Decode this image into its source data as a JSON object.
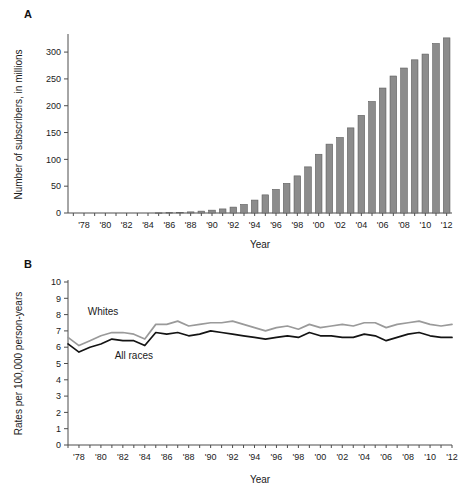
{
  "figure": {
    "panel_a_letter": "A",
    "panel_b_letter": "B"
  },
  "chart_data": [
    {
      "panel": "A",
      "type": "bar",
      "title": "",
      "xlabel": "Year",
      "ylabel": "Number of subscribers, in millions",
      "xlim": [
        1977,
        2012
      ],
      "ylim": [
        0,
        330
      ],
      "yticks": [
        0,
        50,
        100,
        150,
        200,
        250,
        300
      ],
      "ytick_labels": [
        "0",
        "50",
        "100",
        "150",
        "200",
        "250",
        "300"
      ],
      "xtick_labels": [
        "'78",
        "'80",
        "'82",
        "'84",
        "'86",
        "'88",
        "'90",
        "'92",
        "'94",
        "'96",
        "'98",
        "'00",
        "'02",
        "'04",
        "'06",
        "'08",
        "'10",
        "'12"
      ],
      "xtick_years": [
        1978,
        1980,
        1982,
        1984,
        1986,
        1988,
        1990,
        1992,
        1994,
        1996,
        1998,
        2000,
        2002,
        2004,
        2006,
        2008,
        2010,
        2012
      ],
      "grid": false,
      "legend": "none",
      "bar_color": "#8c8c8c",
      "categories": [
        1977,
        1978,
        1979,
        1980,
        1981,
        1982,
        1983,
        1984,
        1985,
        1986,
        1987,
        1988,
        1989,
        1990,
        1991,
        1992,
        1993,
        1994,
        1995,
        1996,
        1997,
        1998,
        1999,
        2000,
        2001,
        2002,
        2003,
        2004,
        2005,
        2006,
        2007,
        2008,
        2009,
        2010,
        2011,
        2012
      ],
      "values": [
        0,
        0,
        0,
        0,
        0,
        0,
        0,
        0,
        0.3,
        0.7,
        1.2,
        2.1,
        3.5,
        5.3,
        7.6,
        11.0,
        16.0,
        24.1,
        33.8,
        44.0,
        55.3,
        69.2,
        86.0,
        109.5,
        128.4,
        140.8,
        158.7,
        182.1,
        207.9,
        233.0,
        255.4,
        270.3,
        285.6,
        296.3,
        316.0,
        326.5
      ],
      "annotations": []
    },
    {
      "panel": "B",
      "type": "line",
      "title": "",
      "xlabel": "Year",
      "ylabel": "Rates per 100,000 person-years",
      "xlim": [
        1977,
        2012
      ],
      "ylim": [
        0,
        10
      ],
      "yticks": [
        0,
        1,
        2,
        3,
        4,
        5,
        6,
        7,
        8,
        9,
        10
      ],
      "ytick_labels": [
        "0",
        "1",
        "2",
        "3",
        "4",
        "5",
        "6",
        "7",
        "8",
        "9",
        "10"
      ],
      "xtick_labels": [
        "'78",
        "'80",
        "'82",
        "'84",
        "'86",
        "'88",
        "'90",
        "'92",
        "'94",
        "'96",
        "'98",
        "'00",
        "'02",
        "'04",
        "'06",
        "'08",
        "'10",
        "'12"
      ],
      "xtick_years": [
        1978,
        1980,
        1982,
        1984,
        1986,
        1988,
        1990,
        1992,
        1994,
        1996,
        1998,
        2000,
        2002,
        2004,
        2006,
        2008,
        2010,
        2012
      ],
      "grid": false,
      "legend": "inline-labels",
      "x": [
        1977,
        1978,
        1979,
        1980,
        1981,
        1982,
        1983,
        1984,
        1985,
        1986,
        1987,
        1988,
        1989,
        1990,
        1991,
        1992,
        1993,
        1994,
        1995,
        1996,
        1997,
        1998,
        1999,
        2000,
        2001,
        2002,
        2003,
        2004,
        2005,
        2006,
        2007,
        2008,
        2009,
        2010,
        2011,
        2012
      ],
      "series": [
        {
          "name": "Whites",
          "color": "#9a9a9a",
          "label_x": 1980.2,
          "label_y": 7.95,
          "values": [
            6.6,
            6.1,
            6.4,
            6.7,
            6.9,
            6.9,
            6.8,
            6.5,
            7.4,
            7.4,
            7.6,
            7.3,
            7.4,
            7.5,
            7.5,
            7.6,
            7.4,
            7.2,
            7.0,
            7.2,
            7.3,
            7.1,
            7.4,
            7.2,
            7.3,
            7.4,
            7.3,
            7.5,
            7.5,
            7.2,
            7.4,
            7.5,
            7.6,
            7.4,
            7.3,
            7.4
          ]
        },
        {
          "name": "All races",
          "color": "#141414",
          "label_x": 1983.0,
          "label_y": 5.3,
          "values": [
            6.2,
            5.7,
            6.0,
            6.2,
            6.5,
            6.4,
            6.4,
            6.1,
            6.9,
            6.8,
            6.9,
            6.7,
            6.8,
            7.0,
            6.9,
            6.8,
            6.7,
            6.6,
            6.5,
            6.6,
            6.7,
            6.6,
            6.9,
            6.7,
            6.7,
            6.6,
            6.6,
            6.8,
            6.7,
            6.4,
            6.6,
            6.8,
            6.9,
            6.7,
            6.6,
            6.6
          ]
        }
      ],
      "annotations": []
    }
  ]
}
